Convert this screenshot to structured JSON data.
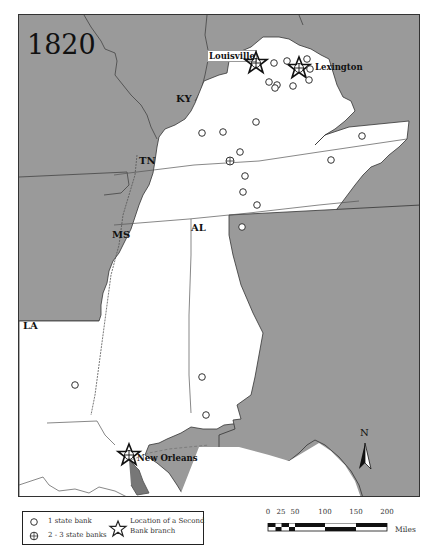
{
  "map": {
    "year": "1820",
    "colors": {
      "background_land": "#9a9a9a",
      "highlight_land": "#ffffff",
      "border": "#333333"
    },
    "state_labels": [
      {
        "id": "ky",
        "text": "KY"
      },
      {
        "id": "tn",
        "text": "TN"
      },
      {
        "id": "ms",
        "text": "MS"
      },
      {
        "id": "al",
        "text": "AL"
      },
      {
        "id": "la",
        "text": "LA"
      }
    ],
    "cities": [
      {
        "id": "louisville",
        "name": "Louisville",
        "symbol": "second-bank-branch-with-2-3-state-banks"
      },
      {
        "id": "lexington",
        "name": "Lexington",
        "symbol": "second-bank-branch-with-2-3-state-banks"
      },
      {
        "id": "new-orleans",
        "name": "New Orleans",
        "symbol": "second-bank-branch-with-2-3-state-banks"
      }
    ],
    "north_arrow": {
      "label": "N"
    }
  },
  "legend": {
    "items": [
      {
        "symbol": "circle",
        "label": "1 state bank"
      },
      {
        "symbol": "circle-cross",
        "label": "2 - 3 state banks"
      },
      {
        "symbol": "star",
        "label": "Location of a Second",
        "label2": "Bank branch"
      }
    ]
  },
  "scale": {
    "ticks": [
      "0",
      "25",
      "50",
      "100",
      "150",
      "200"
    ],
    "unit": "Miles"
  }
}
